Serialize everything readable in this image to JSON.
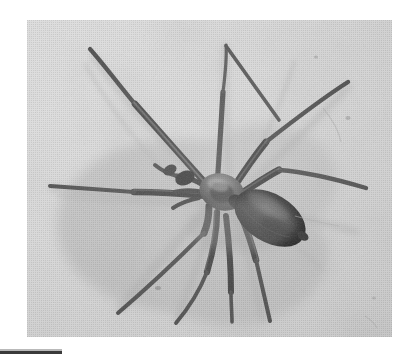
{
  "page": {
    "background_color": "#ffffff",
    "width": 420,
    "height": 358
  },
  "photo": {
    "name": "spider-photograph",
    "alt_text": "Black and white halftone photograph of a brown recluse spider on a pale textured surface",
    "subject": "brown recluse spider",
    "style": "grayscale halftone print",
    "frame": {
      "x": 27,
      "y": 20,
      "width": 365,
      "height": 317
    },
    "colors": {
      "surface_light": "#dcdcdc",
      "surface_mid": "#cfcfcf",
      "surface_shadow": "#b4b4b4",
      "spider_body_dark": "#2b2b2b",
      "spider_abdomen": "#1f1f1f",
      "spider_leg": "#3d3d3d",
      "cast_shadow": "#a8a8a8"
    },
    "subject_details": {
      "leg_count": 8,
      "body_center": {
        "x": 200,
        "y": 180
      },
      "abdomen_center": {
        "x": 243,
        "y": 198
      },
      "abdomen_angle_deg": 32
    }
  },
  "caption_rule": {
    "name": "caption-rule",
    "color": "#3a3a3a",
    "x": 0,
    "y": 351,
    "width": 62,
    "height": 3
  }
}
